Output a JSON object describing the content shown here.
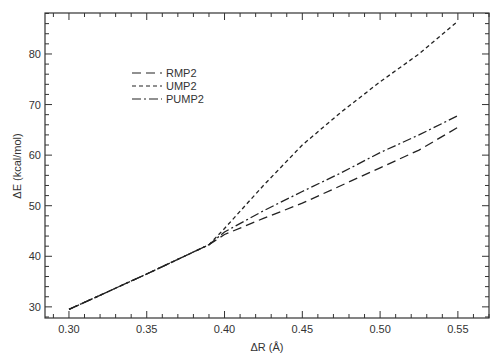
{
  "chart_data": {
    "type": "line",
    "title": "",
    "xlabel": "ΔR (Å)",
    "ylabel": "ΔE (kcal/mol)",
    "xlim": [
      0.2846,
      0.57
    ],
    "ylim": [
      27.8,
      88.1
    ],
    "xticks": [
      0.3,
      0.35,
      0.4,
      0.45,
      0.5,
      0.55
    ],
    "xtick_labels": [
      "0.30",
      "0.35",
      "0.40",
      "0.45",
      "0.50",
      "0.55"
    ],
    "yticks": [
      30,
      40,
      50,
      60,
      70,
      80
    ],
    "ytick_labels": [
      "30",
      "40",
      "50",
      "60",
      "70",
      "80"
    ],
    "grid": false,
    "legend_position": "upper-left",
    "series": [
      {
        "name": "RMP2",
        "style": "long-dash",
        "x": [
          0.3,
          0.35,
          0.39,
          0.4,
          0.425,
          0.45,
          0.475,
          0.5,
          0.525,
          0.55
        ],
        "y": [
          29.5,
          36.5,
          42.3,
          44.3,
          47.5,
          50.5,
          54.0,
          57.5,
          61.0,
          65.5
        ]
      },
      {
        "name": "UMP2",
        "style": "short-dash",
        "x": [
          0.3,
          0.35,
          0.39,
          0.4,
          0.425,
          0.45,
          0.475,
          0.5,
          0.525,
          0.55
        ],
        "y": [
          29.5,
          36.5,
          42.3,
          45.5,
          54.0,
          62.0,
          68.5,
          74.5,
          80.0,
          86.5
        ]
      },
      {
        "name": "PUMP2",
        "style": "dash-dot",
        "x": [
          0.3,
          0.35,
          0.39,
          0.4,
          0.425,
          0.45,
          0.475,
          0.5,
          0.525,
          0.55
        ],
        "y": [
          29.5,
          36.5,
          42.3,
          44.8,
          49.0,
          52.8,
          56.5,
          60.5,
          64.0,
          67.8
        ]
      }
    ]
  },
  "legend": {
    "items": [
      {
        "label": "RMP2"
      },
      {
        "label": "UMP2"
      },
      {
        "label": "PUMP2"
      }
    ]
  },
  "axes": {
    "xlabel": "ΔR (Å)",
    "ylabel": "ΔE (kcal/mol)"
  }
}
